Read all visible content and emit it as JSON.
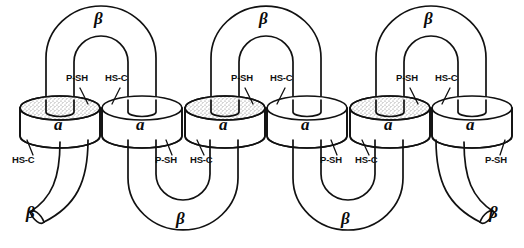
{
  "figure": {
    "background_color": "#ffffff",
    "ink_color": "#111111",
    "stipple_color": "#8c8c8c",
    "width": 524,
    "height": 248
  },
  "subunits": {
    "alpha_label": "a",
    "beta_label": "β",
    "count_alpha": 6,
    "count_beta_top_arches": 3,
    "count_beta_bottom_arches": 2,
    "count_beta_terminal_caps": 2,
    "stippled_cylinders": [
      1,
      3,
      5
    ],
    "cylinders": [
      {
        "label": "a",
        "stippled": true
      },
      {
        "label": "a",
        "stippled": false
      },
      {
        "label": "a",
        "stippled": true
      },
      {
        "label": "a",
        "stippled": false
      },
      {
        "label": "a",
        "stippled": true
      },
      {
        "label": "a",
        "stippled": false
      }
    ]
  },
  "top_beta_labels": [
    {
      "text": "β"
    },
    {
      "text": "β"
    },
    {
      "text": "β"
    }
  ],
  "bottom_beta_labels": [
    {
      "text": "β"
    },
    {
      "text": "β"
    },
    {
      "text": "β"
    },
    {
      "text": "β"
    }
  ],
  "top_thiol_labels": [
    {
      "left": "P-SH",
      "right": "HS-C"
    },
    {
      "left": "P-SH",
      "right": "HS-C"
    },
    {
      "left": "P-SH",
      "right": "HS-C"
    }
  ],
  "bottom_thiol_labels": [
    {
      "text": "HS-C"
    },
    {
      "text": "P-SH"
    },
    {
      "text": "HS-C"
    },
    {
      "text": "P-SH"
    },
    {
      "text": "HS-C"
    },
    {
      "text": "P-SH"
    }
  ]
}
